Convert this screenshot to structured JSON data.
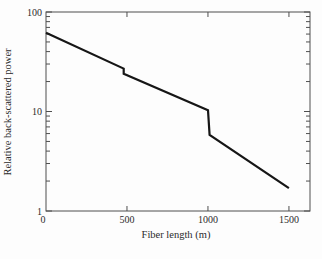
{
  "figure": {
    "background": "#fdfdfd",
    "line_color": "#161616",
    "axis_color": "#4f4f4f",
    "text_color": "#2b2b2b"
  },
  "chart_data": {
    "type": "line",
    "title": "",
    "xlabel": "Fiber length (m)",
    "ylabel": "Relative back-scattered power",
    "x_axis": {
      "scale": "linear",
      "range": [
        0,
        1630
      ],
      "ticks": [
        0,
        500,
        1000,
        1500
      ],
      "tick_labels": [
        "0",
        "500",
        "1000",
        "1500"
      ]
    },
    "y_axis": {
      "scale": "log",
      "range": [
        1,
        100
      ],
      "ticks": [
        1,
        10,
        100
      ],
      "tick_labels": [
        "1",
        "10",
        "100"
      ],
      "minor_tick_mantissas": [
        2,
        3,
        4,
        5,
        6,
        7,
        8,
        9
      ]
    },
    "grid": "off",
    "legend": "none",
    "series": [
      {
        "name": "relative-back-scattered-power",
        "points": [
          [
            0,
            62
          ],
          [
            480,
            27
          ],
          [
            480,
            24
          ],
          [
            1000,
            10.3
          ],
          [
            1010,
            5.8
          ],
          [
            1500,
            1.7
          ]
        ]
      }
    ]
  }
}
